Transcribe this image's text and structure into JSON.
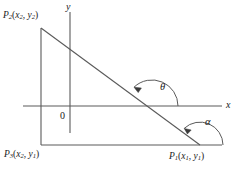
{
  "figure": {
    "background_color": "#ffffff",
    "line_color": "#4d4d4d",
    "text_color": "#1a1a1a",
    "width": 235,
    "height": 170
  },
  "axes": {
    "y_axis_label": "y",
    "x_axis_label": "x",
    "origin_label": "0"
  },
  "points": {
    "p2": {
      "name": "P",
      "name_sub": "2",
      "coord_open": "(",
      "x_var": "x",
      "x_sub": "2",
      "comma": ", ",
      "y_var": "y",
      "y_sub": "2",
      "coord_close": ")",
      "full": "P2(x2, y2)"
    },
    "p3": {
      "name": "P",
      "name_sub": "3",
      "coord_open": "(",
      "x_var": "x",
      "x_sub": "2",
      "comma": ", ",
      "y_var": "y",
      "y_sub": "1",
      "coord_close": ")",
      "full": "P3(x2, y1)"
    },
    "p1": {
      "name": "P",
      "name_sub": "1",
      "coord_open": "(",
      "x_var": "x",
      "x_sub": "1",
      "comma": ", ",
      "y_var": "y",
      "y_sub": "1",
      "coord_close": ")",
      "full": "P1(x1, y1)"
    }
  },
  "angles": {
    "theta": "θ",
    "alpha": "α"
  }
}
